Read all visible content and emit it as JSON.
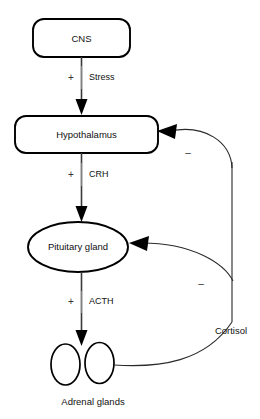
{
  "diagram": {
    "nodes": [
      {
        "id": "cns",
        "label": "CNS",
        "shape": "rounded-rect"
      },
      {
        "id": "hypothalamus",
        "label": "Hypothalamus",
        "shape": "rounded-rect"
      },
      {
        "id": "pituitary",
        "label": "Pituitary gland",
        "shape": "ellipse"
      },
      {
        "id": "adrenal",
        "label": "Adrenal glands",
        "shape": "double-ellipse"
      }
    ],
    "edges": [
      {
        "id": "cns-to-hypothalamus",
        "sign": "+",
        "label": "Stress",
        "from": "cns",
        "to": "hypothalamus",
        "type": "stimulatory"
      },
      {
        "id": "hypothalamus-to-pituitary",
        "sign": "+",
        "label": "CRH",
        "from": "hypothalamus",
        "to": "pituitary",
        "type": "stimulatory"
      },
      {
        "id": "pituitary-to-adrenal",
        "sign": "+",
        "label": "ACTH",
        "from": "pituitary",
        "to": "adrenal",
        "type": "stimulatory"
      }
    ],
    "feedback": {
      "substance_label": "Cortisol",
      "source": "adrenal",
      "loops": [
        {
          "id": "cortisol-to-hypothalamus",
          "sign": "–",
          "target": "hypothalamus",
          "type": "inhibitory"
        },
        {
          "id": "cortisol-to-pituitary",
          "sign": "–",
          "target": "pituitary",
          "type": "inhibitory"
        }
      ]
    },
    "colors": {
      "background": "#ffffff",
      "outline": "#000000",
      "flow_arrow": "#3a3a3a",
      "feedback_line": "#2a2a2a",
      "text": "#111111"
    }
  }
}
